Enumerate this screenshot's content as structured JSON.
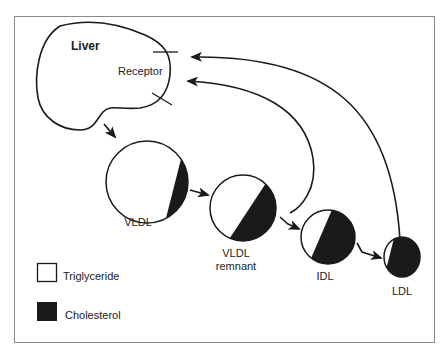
{
  "diagram": {
    "liver": {
      "label": "Liver",
      "receptor_label": "Receptor"
    },
    "particles": [
      {
        "id": "vldl",
        "label": "VLDL",
        "label2": ""
      },
      {
        "id": "vldl-remnant",
        "label": "VLDL",
        "label2": "remnant"
      },
      {
        "id": "idl",
        "label": "IDL",
        "label2": ""
      },
      {
        "id": "ldl",
        "label": "LDL",
        "label2": ""
      }
    ],
    "legend": [
      {
        "label": "Triglyceride",
        "color": "#ffffff"
      },
      {
        "label": "Cholesterol",
        "color": "#1a1a1a"
      }
    ],
    "colors": {
      "stroke": "#1a1a1a",
      "fill_cholesterol": "#1a1a1a",
      "fill_triglyceride": "#ffffff",
      "border": "#888888"
    }
  }
}
